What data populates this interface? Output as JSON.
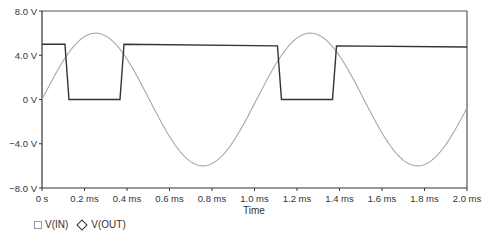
{
  "chart_data": {
    "type": "line",
    "title": "",
    "xlabel": "Time",
    "ylabel": "",
    "xlim": [
      0,
      2.0
    ],
    "ylim": [
      -8.0,
      8.0
    ],
    "x_unit": "ms",
    "grid": false,
    "legend_position": "bottom-left",
    "x_ticks": [
      {
        "value": 0,
        "label": "0 s"
      },
      {
        "value": 0.2,
        "label": "0.2 ms"
      },
      {
        "value": 0.4,
        "label": "0.4 ms"
      },
      {
        "value": 0.6,
        "label": "0.6 ms"
      },
      {
        "value": 0.8,
        "label": "0.8 ms"
      },
      {
        "value": 1.0,
        "label": "1.0 ms"
      },
      {
        "value": 1.2,
        "label": "1.2 ms"
      },
      {
        "value": 1.4,
        "label": "1.4 ms"
      },
      {
        "value": 1.6,
        "label": "1.6 ms"
      },
      {
        "value": 1.8,
        "label": "1.8 ms"
      },
      {
        "value": 2.0,
        "label": "2.0 ms"
      }
    ],
    "y_ticks": [
      {
        "value": 8,
        "label": "8.0 V"
      },
      {
        "value": 4,
        "label": "4.0 V"
      },
      {
        "value": 0,
        "label": "0 V"
      },
      {
        "value": -4,
        "label": "-4.0 V"
      },
      {
        "value": -8,
        "label": "-8.0 V"
      }
    ],
    "series": [
      {
        "name": "V(IN)",
        "marker": "square",
        "color": "#a8a8a8",
        "shape": "sine",
        "amplitude_v": 6.0,
        "frequency_khz": 0.99,
        "x": [
          0,
          0.125,
          0.25,
          0.375,
          0.5,
          0.625,
          0.75,
          0.875,
          1.0,
          1.125,
          1.25,
          1.375,
          1.5,
          1.625,
          1.75,
          1.875,
          2.0
        ],
        "values": [
          0,
          4.2,
          6.0,
          4.3,
          0.1,
          -4.2,
          -6.0,
          -4.3,
          -0.2,
          4.1,
          6.0,
          4.4,
          0.3,
          -4.1,
          -6.0,
          -4.5,
          -0.4
        ]
      },
      {
        "name": "V(OUT)",
        "marker": "diamond",
        "color": "#333333",
        "shape": "square",
        "x": [
          0,
          0.108,
          0.127,
          0.367,
          0.386,
          1.108,
          1.127,
          1.367,
          1.386,
          2.0
        ],
        "values": [
          5.0,
          5.0,
          0.0,
          0.0,
          5.0,
          4.85,
          0.0,
          0.0,
          4.85,
          4.75
        ]
      }
    ]
  },
  "legend": {
    "items": [
      {
        "label": "V(IN)",
        "symbol": "square"
      },
      {
        "label": "V(OUT)",
        "symbol": "diamond"
      }
    ]
  }
}
